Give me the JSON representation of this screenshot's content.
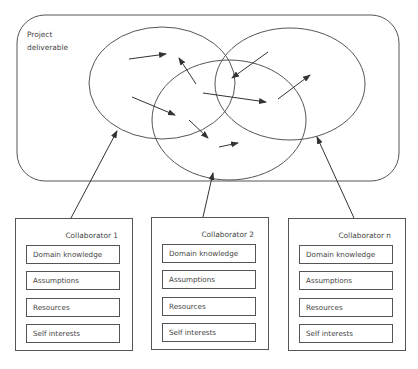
{
  "diagram": {
    "deliverable": {
      "label_line1": "Project",
      "label_line2": "deliverable"
    },
    "collaborators": [
      {
        "title": "Collaborator 1",
        "attributes": [
          "Domain knowledge",
          "Assumptions",
          "Resources",
          "Self interests"
        ]
      },
      {
        "title": "Collaborator 2",
        "attributes": [
          "Domain knowledge",
          "Assumptions",
          "Resources",
          "Self interests"
        ]
      },
      {
        "title": "Collaborator n",
        "attributes": [
          "Domain knowledge",
          "Assumptions",
          "Resources",
          "Self interests"
        ]
      }
    ],
    "colors": {
      "stroke": "#555555",
      "text": "#444444",
      "background": "#ffffff"
    }
  }
}
